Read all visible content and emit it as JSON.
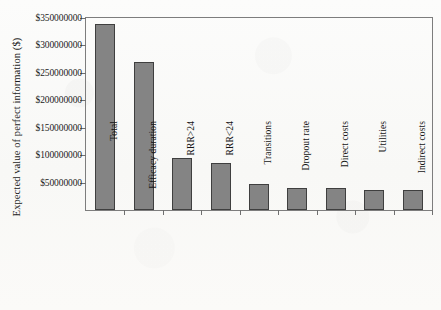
{
  "chart_data": {
    "type": "bar",
    "title": "",
    "subtitle": "",
    "xlabel": "",
    "ylabel": "Expected value of perfect information ($)",
    "categories": [
      "Total",
      "Efficacy duration",
      "RRR>24",
      "RRR<24",
      "Transitions",
      "Dropout rate",
      "Direct costs",
      "Utilities",
      "Indirect costs"
    ],
    "values": [
      340000000,
      270000000,
      95000000,
      85000000,
      48000000,
      41000000,
      40000000,
      36000000,
      37000000
    ],
    "ylim": [
      0,
      350000000
    ],
    "yticks": [
      50000000,
      100000000,
      150000000,
      200000000,
      250000000,
      300000000,
      350000000
    ],
    "ytick_labels": [
      "$50000000",
      "$100000000",
      "$150000000",
      "$200000000",
      "$250000000",
      "$300000000",
      "$350000000"
    ],
    "grid": false,
    "legend": null,
    "bar_color": "#848484",
    "bar_edge_color": "#3f3f3f",
    "axis_color": "#7d7d7d",
    "background_color": "#fbfbfa"
  }
}
